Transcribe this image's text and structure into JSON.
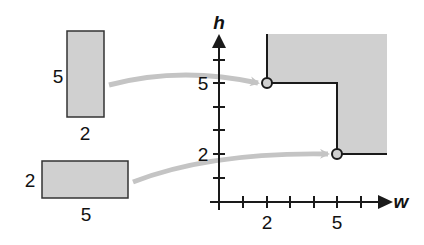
{
  "rect_tall": {
    "height_label": "5",
    "width_label": "2"
  },
  "rect_wide": {
    "height_label": "2",
    "width_label": "5"
  },
  "axes": {
    "x_label": "w",
    "y_label": "h",
    "x_ticks": [
      "2",
      "5"
    ],
    "y_ticks": [
      "5",
      "2"
    ]
  },
  "points": [
    {
      "w": 2,
      "h": 5
    },
    {
      "w": 5,
      "h": 2
    }
  ],
  "colors": {
    "fill": "#d0d0d0",
    "stroke": "#1a1a1a",
    "arrow": "#c4c4c4"
  }
}
